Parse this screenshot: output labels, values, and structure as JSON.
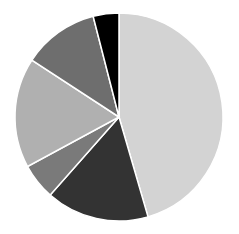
{
  "chart_data": {
    "type": "pie",
    "title": "",
    "start_angle_deg": 0,
    "direction": "clockwise",
    "labels": [
      "Slice 1",
      "Slice 2",
      "Slice 3",
      "Slice 4",
      "Slice 5",
      "Slice 6"
    ],
    "values": [
      45.5,
      16.0,
      5.6,
      17.1,
      11.8,
      4.0
    ],
    "colors": [
      "#d3d3d3",
      "#333333",
      "#7a7a7a",
      "#b0b0b0",
      "#6e6e6e",
      "#000000"
    ],
    "legend": false,
    "center": [
      119,
      117
    ],
    "radius": 104
  }
}
